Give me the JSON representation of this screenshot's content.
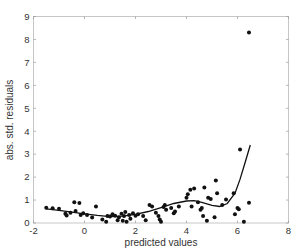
{
  "chart_data": {
    "type": "scatter",
    "title": "",
    "xlabel": "predicted values",
    "ylabel": "abs. std. residuals",
    "xlim": [
      -2,
      8
    ],
    "ylim": [
      0,
      9
    ],
    "xticks": [
      -2,
      0,
      2,
      4,
      6,
      8
    ],
    "yticks": [
      0,
      1,
      2,
      3,
      4,
      5,
      6,
      7,
      8,
      9
    ],
    "grid": false,
    "legend": null,
    "series": [
      {
        "name": "residuals",
        "kind": "scatter",
        "points": [
          [
            -1.5,
            0.66
          ],
          [
            -1.25,
            0.64
          ],
          [
            -1.0,
            0.62
          ],
          [
            -0.75,
            0.4
          ],
          [
            -0.7,
            0.33
          ],
          [
            -0.55,
            0.45
          ],
          [
            -0.4,
            0.9
          ],
          [
            -0.35,
            0.52
          ],
          [
            -0.2,
            0.87
          ],
          [
            -0.15,
            0.35
          ],
          [
            -0.05,
            0.42
          ],
          [
            0.1,
            0.35
          ],
          [
            0.3,
            0.24
          ],
          [
            0.45,
            0.72
          ],
          [
            0.7,
            0.15
          ],
          [
            0.85,
            0.05
          ],
          [
            0.9,
            0.3
          ],
          [
            1.0,
            0.28
          ],
          [
            1.1,
            0.38
          ],
          [
            1.2,
            0.32
          ],
          [
            1.3,
            0.12
          ],
          [
            1.35,
            0.25
          ],
          [
            1.45,
            0.4
          ],
          [
            1.5,
            0.1
          ],
          [
            1.55,
            0.3
          ],
          [
            1.6,
            0.48
          ],
          [
            1.65,
            0.05
          ],
          [
            1.75,
            0.35
          ],
          [
            1.8,
            0.18
          ],
          [
            1.9,
            0.42
          ],
          [
            2.0,
            0.32
          ],
          [
            2.1,
            0.38
          ],
          [
            2.3,
            0.3
          ],
          [
            2.4,
            0.12
          ],
          [
            2.55,
            0.78
          ],
          [
            2.65,
            0.72
          ],
          [
            2.8,
            0.45
          ],
          [
            2.9,
            0.3
          ],
          [
            2.95,
            0.15
          ],
          [
            3.0,
            0.05
          ],
          [
            3.1,
            0.7
          ],
          [
            3.15,
            0.78
          ],
          [
            3.2,
            0.58
          ],
          [
            3.4,
            0.65
          ],
          [
            3.5,
            0.42
          ],
          [
            3.55,
            0.5
          ],
          [
            3.7,
            0.72
          ],
          [
            4.0,
            1.1
          ],
          [
            4.05,
            1.25
          ],
          [
            4.15,
            1.45
          ],
          [
            4.2,
            0.72
          ],
          [
            4.3,
            1.5
          ],
          [
            4.45,
            0.9
          ],
          [
            4.55,
            0.58
          ],
          [
            4.6,
            0.65
          ],
          [
            4.65,
            0.3
          ],
          [
            4.7,
            1.55
          ],
          [
            4.8,
            0.1
          ],
          [
            4.85,
            1.1
          ],
          [
            4.95,
            1.05
          ],
          [
            5.1,
            0.25
          ],
          [
            5.15,
            1.85
          ],
          [
            5.2,
            1.3
          ],
          [
            5.4,
            0.78
          ],
          [
            5.55,
            1.02
          ],
          [
            5.85,
            1.3
          ],
          [
            5.9,
            0.38
          ],
          [
            6.0,
            0.65
          ],
          [
            6.05,
            0.6
          ],
          [
            6.25,
            0.05
          ],
          [
            6.45,
            0.88
          ],
          [
            6.1,
            3.2
          ],
          [
            6.45,
            8.3
          ]
        ]
      },
      {
        "name": "smooth fit",
        "kind": "line",
        "points": [
          [
            -1.5,
            0.62
          ],
          [
            -1.0,
            0.55
          ],
          [
            -0.5,
            0.47
          ],
          [
            0.0,
            0.4
          ],
          [
            0.5,
            0.33
          ],
          [
            1.0,
            0.28
          ],
          [
            1.5,
            0.3
          ],
          [
            2.0,
            0.38
          ],
          [
            2.5,
            0.5
          ],
          [
            3.0,
            0.67
          ],
          [
            3.5,
            0.85
          ],
          [
            4.0,
            0.96
          ],
          [
            4.3,
            0.97
          ],
          [
            4.6,
            0.9
          ],
          [
            5.0,
            0.77
          ],
          [
            5.3,
            0.72
          ],
          [
            5.6,
            0.85
          ],
          [
            5.9,
            1.3
          ],
          [
            6.1,
            1.9
          ],
          [
            6.3,
            2.65
          ],
          [
            6.5,
            3.4
          ]
        ]
      }
    ]
  }
}
